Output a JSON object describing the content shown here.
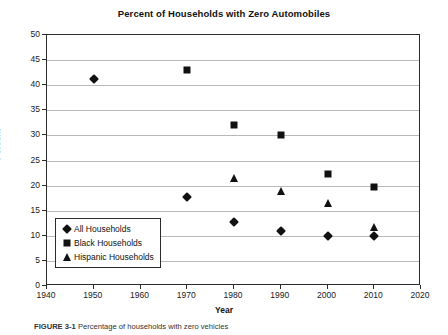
{
  "chart_data": {
    "type": "scatter",
    "title": "Percent of Households with Zero Automobiles",
    "xlabel": "Year",
    "ylabel": "Percent",
    "xlim": [
      1940,
      2020
    ],
    "ylim": [
      0,
      50
    ],
    "xticks": [
      1940,
      1950,
      1960,
      1970,
      1980,
      1990,
      2000,
      2010,
      2020
    ],
    "yticks": [
      0,
      5,
      10,
      15,
      20,
      25,
      30,
      35,
      40,
      45,
      50
    ],
    "grid": "horizontal",
    "legend_position": "lower-left-inside",
    "series": [
      {
        "name": "All Households",
        "marker": "diamond",
        "color": "#111111",
        "points": [
          {
            "x": 1950,
            "y": 41.2
          },
          {
            "x": 1970,
            "y": 17.8
          },
          {
            "x": 1980,
            "y": 12.7
          },
          {
            "x": 1990,
            "y": 11.0
          },
          {
            "x": 2000,
            "y": 10.0
          },
          {
            "x": 2010,
            "y": 10.0
          }
        ]
      },
      {
        "name": "Black Households",
        "marker": "square",
        "color": "#111111",
        "points": [
          {
            "x": 1970,
            "y": 43.0
          },
          {
            "x": 1980,
            "y": 32.1
          },
          {
            "x": 1990,
            "y": 30.1
          },
          {
            "x": 2000,
            "y": 22.3
          },
          {
            "x": 2010,
            "y": 19.7
          }
        ]
      },
      {
        "name": "Hispanic Households",
        "marker": "triangle",
        "color": "#111111",
        "points": [
          {
            "x": 1980,
            "y": 21.5
          },
          {
            "x": 1990,
            "y": 18.9
          },
          {
            "x": 2000,
            "y": 16.5
          },
          {
            "x": 2010,
            "y": 11.8
          }
        ]
      }
    ]
  },
  "legend": {
    "entries": [
      {
        "label": "All Households",
        "marker": "diamond"
      },
      {
        "label": "Black Households",
        "marker": "square"
      },
      {
        "label": "Hispanic Households",
        "marker": "triangle"
      }
    ]
  },
  "caption": {
    "figure_number": "FIGURE 3-1",
    "text": "Percentage of households with zero vehicles"
  }
}
